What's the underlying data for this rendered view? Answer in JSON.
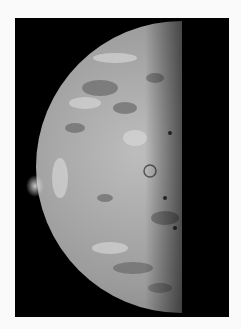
{
  "image": {
    "subject": "Half-illuminated moon with volcanic plume on the limb",
    "alt": "Grayscale photograph of a half-lit moon against black space",
    "colors": {
      "background": "#fafafa",
      "space": "#000000",
      "surface_light": "#c8c8c8",
      "surface_mid": "#9a9a9a",
      "surface_dark": "#5a5a5a"
    }
  }
}
